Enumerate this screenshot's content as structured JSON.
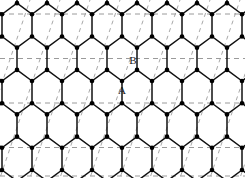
{
  "figure": {
    "type": "honeycomb-lattice-diagram",
    "width": 245,
    "height": 178,
    "background": "#ffffff"
  },
  "labels": [
    {
      "id": "label-A",
      "text": "A",
      "x": 122,
      "y": 90
    },
    {
      "id": "label-B",
      "text": "B",
      "x": 133,
      "y": 60
    }
  ],
  "lattice": {
    "orientation": "pointy-top",
    "x_period": 30,
    "y_period": 44.5,
    "x_origin": 2,
    "y_origin": -8,
    "columns": 9,
    "rows": 5,
    "edge_color": "#111111",
    "edge_width": 1.5,
    "vertex_color": "#000000",
    "vertex_radius": 2.3
  },
  "guides": {
    "horizontal": {
      "color": "#9a9a9a",
      "width": 1,
      "dash": "5,4",
      "y_values": [
        14,
        58.5,
        103,
        147.5,
        176
      ]
    },
    "diagonal": {
      "color": "#a8a8a8",
      "width": 1,
      "dash": "4,4",
      "slope_dx": 15,
      "slope_dy": -44.5,
      "x_intercepts": [
        -30,
        0,
        30,
        60,
        90,
        120,
        150,
        180,
        210,
        240,
        270,
        300,
        330,
        360
      ]
    }
  }
}
